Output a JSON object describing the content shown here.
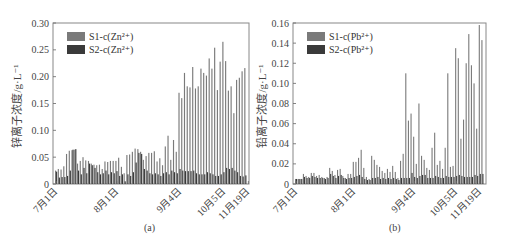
{
  "figure": {
    "panels": [
      {
        "id": "a",
        "caption": "(a)",
        "ylabel": "锌离子浓度/g·L⁻¹",
        "legend": [
          {
            "label": "S1-c(Zn²⁺)",
            "color": "#7a7a7a"
          },
          {
            "label": "S2-c(Zn²⁺)",
            "color": "#3a3a3a"
          }
        ]
      },
      {
        "id": "b",
        "caption": "(b)",
        "ylabel": "铅离子浓度/g·L⁻¹",
        "legend": [
          {
            "label": "S1-c(Pb²⁺)",
            "color": "#7a7a7a"
          },
          {
            "label": "S2-c(Pb²⁺)",
            "color": "#3a3a3a"
          }
        ]
      }
    ]
  },
  "chart_data": [
    {
      "type": "bar",
      "title": "",
      "caption": "(a)",
      "xlabel": "",
      "ylabel": "锌离子浓度/g·L⁻¹",
      "ylim": [
        0,
        0.3
      ],
      "yticks": [
        0,
        0.05,
        0.1,
        0.15,
        0.2,
        0.25,
        0.3
      ],
      "ytick_labels": [
        "0",
        "0.05",
        "0.10",
        "0.15",
        "0.20",
        "0.25",
        "0.30"
      ],
      "xtick_labels": [
        "7月1日",
        "8月1日",
        "9月4日",
        "10月5日",
        "11月19日"
      ],
      "xtick_index": [
        0,
        22,
        45,
        61,
        70
      ],
      "grid": false,
      "legend_position": "upper left",
      "series": [
        {
          "name": "S1-c(Zn²⁺)",
          "color": "#7a7a7a",
          "values": [
            0.025,
            0.028,
            0.027,
            0.033,
            0.056,
            0.062,
            0.063,
            0.064,
            0.038,
            0.043,
            0.05,
            0.044,
            0.043,
            0.038,
            0.036,
            0.035,
            0.036,
            0.028,
            0.042,
            0.041,
            0.043,
            0.043,
            0.043,
            0.049,
            0.032,
            0.02,
            0.054,
            0.055,
            0.06,
            0.066,
            0.065,
            0.06,
            0.045,
            0.052,
            0.058,
            0.058,
            0.061,
            0.042,
            0.048,
            0.035,
            0.07,
            0.09,
            0.045,
            0.082,
            0.06,
            0.17,
            0.16,
            0.207,
            0.182,
            0.18,
            0.218,
            0.178,
            0.182,
            0.215,
            0.207,
            0.202,
            0.234,
            0.215,
            0.254,
            0.175,
            0.228,
            0.265,
            0.229,
            0.174,
            0.182,
            0.132,
            0.194,
            0.198,
            0.21,
            0.216
          ]
        },
        {
          "name": "S2-c(Zn²⁺)",
          "color": "#3a3a3a",
          "values": [
            0.023,
            0.012,
            0.013,
            0.013,
            0.015,
            0.025,
            0.064,
            0.065,
            0.025,
            0.018,
            0.03,
            0.02,
            0.038,
            0.035,
            0.03,
            0.022,
            0.018,
            0.02,
            0.025,
            0.018,
            0.022,
            0.02,
            0.024,
            0.015,
            0.018,
            0.005,
            0.018,
            0.015,
            0.022,
            0.04,
            0.058,
            0.056,
            0.028,
            0.025,
            0.02,
            0.018,
            0.02,
            0.018,
            0.015,
            0.02,
            0.022,
            0.018,
            0.025,
            0.022,
            0.02,
            0.028,
            0.025,
            0.024,
            0.024,
            0.024,
            0.025,
            0.02,
            0.018,
            0.018,
            0.018,
            0.022,
            0.02,
            0.018,
            0.015,
            0.015,
            0.018,
            0.022,
            0.03,
            0.028,
            0.03,
            0.025,
            0.022,
            0.015,
            0.014,
            0.016
          ]
        }
      ]
    },
    {
      "type": "bar",
      "title": "",
      "caption": "(b)",
      "xlabel": "",
      "ylabel": "铅离子浓度/g·L⁻¹",
      "ylim": [
        0,
        0.16
      ],
      "yticks": [
        0,
        0.02,
        0.04,
        0.06,
        0.08,
        0.1,
        0.12,
        0.14,
        0.16
      ],
      "ytick_labels": [
        "0",
        "0.02",
        "0.04",
        "0.06",
        "0.08",
        "0.10",
        "0.12",
        "0.14",
        "0.16"
      ],
      "xtick_labels": [
        "7月1日",
        "8月1日",
        "9月4日",
        "10月5日",
        "11月19日"
      ],
      "xtick_index": [
        0,
        22,
        45,
        61,
        70
      ],
      "grid": false,
      "legend_position": "upper left",
      "series": [
        {
          "name": "S1-c(Pb²⁺)",
          "color": "#7a7a7a",
          "values": [
            0.005,
            0.005,
            0.005,
            0.01,
            0.008,
            0.007,
            0.011,
            0.011,
            0.008,
            0.009,
            0.007,
            0.006,
            0.007,
            0.016,
            0.013,
            0.009,
            0.014,
            0.015,
            0.008,
            0.006,
            0.01,
            0.01,
            0.022,
            0.022,
            0.026,
            0.034,
            0.016,
            0.007,
            0.005,
            0.028,
            0.024,
            0.019,
            0.017,
            0.013,
            0.011,
            0.015,
            0.012,
            0.018,
            0.012,
            0.006,
            0.023,
            0.03,
            0.11,
            0.063,
            0.07,
            0.047,
            0.02,
            0.08,
            0.028,
            0.024,
            0.016,
            0.014,
            0.036,
            0.051,
            0.019,
            0.023,
            0.015,
            0.036,
            0.11,
            0.017,
            0.018,
            0.135,
            0.125,
            0.045,
            0.064,
            0.12,
            0.149,
            0.118,
            0.1,
            0.055,
            0.158,
            0.143
          ]
        },
        {
          "name": "S2-c(Pb²⁺)",
          "color": "#3a3a3a",
          "values": [
            0.005,
            0.005,
            0.005,
            0.007,
            0.006,
            0.006,
            0.008,
            0.007,
            0.006,
            0.006,
            0.006,
            0.005,
            0.006,
            0.01,
            0.008,
            0.006,
            0.008,
            0.009,
            0.006,
            0.005,
            0.006,
            0.006,
            0.007,
            0.008,
            0.009,
            0.007,
            0.005,
            0.004,
            0.004,
            0.006,
            0.006,
            0.007,
            0.005,
            0.006,
            0.005,
            0.006,
            0.005,
            0.006,
            0.005,
            0.004,
            0.006,
            0.006,
            0.006,
            0.006,
            0.011,
            0.007,
            0.006,
            0.008,
            0.009,
            0.009,
            0.006,
            0.006,
            0.006,
            0.008,
            0.007,
            0.006,
            0.006,
            0.008,
            0.007,
            0.007,
            0.007,
            0.008,
            0.009,
            0.008,
            0.007,
            0.007,
            0.007,
            0.007,
            0.009,
            0.008,
            0.01,
            0.01
          ]
        }
      ]
    }
  ]
}
